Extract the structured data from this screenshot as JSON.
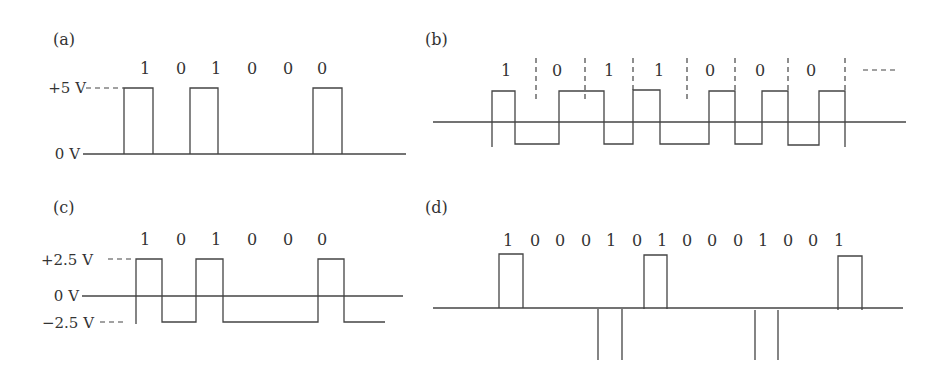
{
  "colors": {
    "line": "#444444",
    "text": "#333333",
    "background": "#ffffff"
  },
  "panels": [
    {
      "id": "a",
      "label": "(a)",
      "encoding_levels": [
        "+5 V",
        "0 V"
      ],
      "bits": [
        "1",
        "0",
        "1",
        "0",
        "0",
        "0"
      ],
      "label_pos": [
        53,
        45
      ],
      "bit_positions": [
        145,
        181,
        216,
        252,
        288,
        322
      ],
      "bit_y": 74,
      "voltage_labels": [
        {
          "text": "+5 V",
          "x": 86,
          "y": 93
        },
        {
          "text": "0 V",
          "x": 80,
          "y": 159
        }
      ],
      "baseline": {
        "x1": 83,
        "x2": 406,
        "y": 154
      },
      "dashes": [
        {
          "x1": 86,
          "x2": 124,
          "y1": 88,
          "y2": 88
        }
      ],
      "waveform": "M124,154 L124,88 L153,88 L153,154 M190,154 L190,88 L218,88 L218,154 M313,154 L313,88 L342,88 L342,154"
    },
    {
      "id": "b",
      "label": "(b)",
      "bits": [
        "1",
        "0",
        "1",
        "1",
        "0",
        "0",
        "0"
      ],
      "trailing": "---",
      "label_pos": [
        425,
        45
      ],
      "bit_positions": [
        506,
        557,
        609,
        659,
        710,
        760,
        811
      ],
      "bit_y": 76,
      "trailing_pos": [
        879,
        70
      ],
      "baseline": {
        "x1": 433,
        "x2": 906,
        "y": 122
      },
      "dashes": [
        {
          "x1": 536,
          "x2": 536,
          "y1": 58,
          "y2": 100
        },
        {
          "x1": 585,
          "x2": 585,
          "y1": 58,
          "y2": 100
        },
        {
          "x1": 633,
          "x2": 633,
          "y1": 58,
          "y2": 90
        },
        {
          "x1": 687,
          "x2": 687,
          "y1": 58,
          "y2": 100
        },
        {
          "x1": 735,
          "x2": 735,
          "y1": 58,
          "y2": 90
        },
        {
          "x1": 788,
          "x2": 788,
          "y1": 58,
          "y2": 90
        },
        {
          "x1": 845,
          "x2": 845,
          "y1": 58,
          "y2": 90
        }
      ],
      "waveform": "M492,147 L492,91 L515,91 L515,144 L559,144 L559,91 L604,91 L604,144 L633,144 L633,90 L660,90 L660,144 L709,144 L709,91 L735,91 L735,144 L762,144 L762,91 L788,91 L788,145 L819,145 L819,91 L845,91 L845,147"
    },
    {
      "id": "c",
      "label": "(c)",
      "encoding_levels": [
        "+2.5 V",
        "0 V",
        "−2.5 V"
      ],
      "bits": [
        "1",
        "0",
        "1",
        "0",
        "0",
        "0"
      ],
      "label_pos": [
        53,
        213
      ],
      "bit_positions": [
        145,
        181,
        216,
        252,
        288,
        322
      ],
      "bit_y": 245,
      "voltage_labels": [
        {
          "text": "+2.5 V",
          "x": 93,
          "y": 265
        },
        {
          "text": "0 V",
          "x": 79,
          "y": 301
        },
        {
          "text": "−2.5 V",
          "x": 94,
          "y": 328
        }
      ],
      "baseline": {
        "x1": 82,
        "x2": 403,
        "y": 296
      },
      "dashes": [
        {
          "x1": 108,
          "x2": 135,
          "y1": 259,
          "y2": 259
        },
        {
          "x1": 100,
          "x2": 126,
          "y1": 322,
          "y2": 322
        }
      ],
      "waveform": "M136,324 L136,259 L162,259 L162,322 L196,322 L196,259 L223,259 L223,322 L318,322 L318,259 L344,259 L344,322 L385,322"
    },
    {
      "id": "d",
      "label": "(d)",
      "bits": [
        "1",
        "0",
        "0",
        "0",
        "1",
        "0",
        "1",
        "0",
        "0",
        "0",
        "1",
        "0",
        "0",
        "1"
      ],
      "label_pos": [
        425,
        213
      ],
      "bit_positions": [
        508,
        535,
        560,
        586,
        611,
        637,
        662,
        687,
        712,
        738,
        763,
        788,
        813,
        839
      ],
      "bit_y": 246,
      "baseline": {
        "x1": 433,
        "x2": 903,
        "y": 308
      },
      "dashes": [],
      "waveform": "M499,308 L499,254 L523,254 L523,308 M644,309 L644,255 L667,255 L667,309 M838,310 L838,256 L862,256 L862,310 M598,309 L598,360 M622,309 L622,360 M755,310 L755,360 M778,310 L778,360"
    }
  ]
}
